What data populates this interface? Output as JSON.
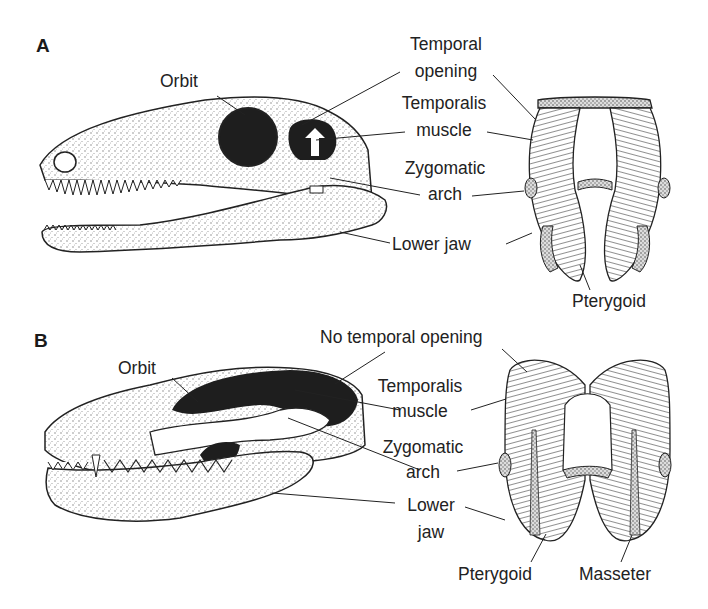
{
  "panels": {
    "a": {
      "letter": "A",
      "labels": {
        "orbit": "Orbit",
        "temporal_opening_1": "Temporal",
        "temporal_opening_2": "opening",
        "temporalis_1": "Temporalis",
        "temporalis_2": "muscle",
        "zygomatic_1": "Zygomatic",
        "zygomatic_2": "arch",
        "lower_jaw": "Lower jaw",
        "pterygoid": "Pterygoid"
      }
    },
    "b": {
      "letter": "B",
      "labels": {
        "orbit": "Orbit",
        "no_temporal_opening": "No temporal opening",
        "temporalis_1": "Temporalis",
        "temporalis_2": "muscle",
        "zygomatic_1": "Zygomatic",
        "zygomatic_2": "arch",
        "lower_jaw_1": "Lower",
        "lower_jaw_2": "jaw",
        "pterygoid": "Pterygoid",
        "masseter": "Masseter"
      }
    }
  },
  "colors": {
    "ink": "#222222",
    "background": "#ffffff",
    "dark_fill": "#1e1e1e",
    "stipple": "#bdbdbd"
  }
}
